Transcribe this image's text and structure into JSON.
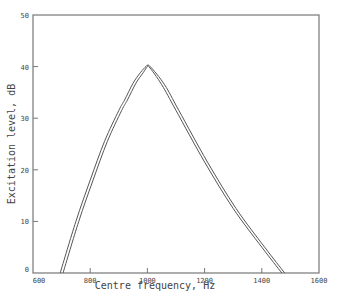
{
  "chart_data": {
    "type": "line",
    "title": "",
    "xlabel": "Centre frequency, Hz",
    "ylabel": "Excitation level, dB",
    "xlim": [
      600,
      1600
    ],
    "ylim": [
      0,
      50
    ],
    "xticks": [
      600,
      800,
      1000,
      1200,
      1400,
      1600
    ],
    "yticks": [
      0,
      10,
      20,
      30,
      40,
      50
    ],
    "grid": false,
    "legend": null,
    "series": [
      {
        "name": "curve-1",
        "x": [
          695,
          750,
          800,
          850,
          900,
          920,
          950,
          975,
          995,
          1005,
          1050,
          1100,
          1200,
          1300,
          1400,
          1470
        ],
        "y": [
          0,
          10,
          18,
          25.5,
          31.5,
          33.5,
          36.8,
          38.8,
          40,
          40,
          36.5,
          31.5,
          21.5,
          12.5,
          5,
          0
        ]
      },
      {
        "name": "curve-2",
        "x": [
          705,
          760,
          810,
          860,
          910,
          930,
          960,
          985,
          1000,
          1010,
          1060,
          1110,
          1210,
          1310,
          1410,
          1480
        ],
        "y": [
          0,
          10,
          18,
          25.5,
          31.5,
          33.5,
          36.8,
          38.8,
          40,
          40,
          36.5,
          31.5,
          21.5,
          12.5,
          5,
          0
        ]
      }
    ]
  }
}
